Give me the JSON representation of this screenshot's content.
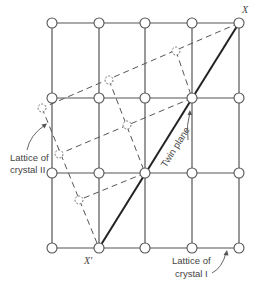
{
  "figure": {
    "type": "twin-boundary-lattice-diagram",
    "labels": {
      "x_top": "X",
      "x_bottom": "X'",
      "twin_plane": "Twin plane",
      "crystal_2_line1": "Lattice of",
      "crystal_2_line2": "crystal II",
      "crystal_1_line1": "Lattice of",
      "crystal_1_line2": "crystal I"
    },
    "lattice_1": {
      "columns_x": [
        52,
        99,
        145,
        192,
        239
      ],
      "rows_y": [
        23,
        98,
        173,
        248
      ],
      "style": "solid"
    },
    "lattice_2": {
      "style": "dashed",
      "nodes": [
        [
          239,
          23
        ],
        [
          176,
          51
        ],
        [
          109,
          80
        ],
        [
          42,
          108
        ],
        [
          192,
          98
        ],
        [
          127,
          125
        ],
        [
          59,
          154
        ],
        [
          145,
          173
        ],
        [
          79,
          200
        ],
        [
          99,
          248
        ]
      ]
    },
    "twin_plane_line": {
      "from": [
        99,
        248
      ],
      "to": [
        239,
        23
      ]
    },
    "colors": {
      "line": "#555555",
      "twin_plane": "#222222",
      "text": "#444444",
      "background": "#ffffff"
    }
  }
}
